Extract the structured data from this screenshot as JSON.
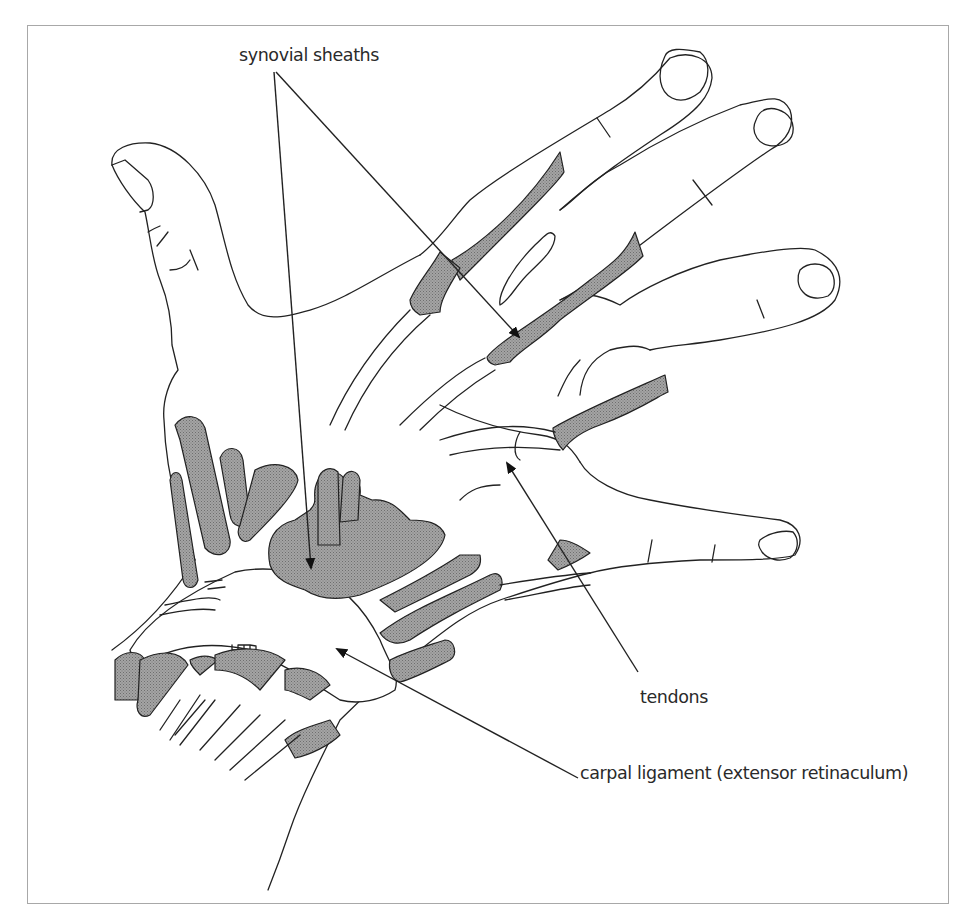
{
  "figure": {
    "frame": {
      "x": 27,
      "y": 25,
      "width": 922,
      "height": 879,
      "border_color": "#a8a8a8"
    },
    "colors": {
      "line": "#222222",
      "sheath_fill": "#9a9a9a",
      "background": "#ffffff",
      "label_text": "#2a2a2a"
    }
  },
  "labels": {
    "synovial_sheaths": {
      "text": "synovial sheaths",
      "x": 239,
      "y": 46
    },
    "tendons": {
      "text": "tendons",
      "x": 640,
      "y": 689
    },
    "carpal_ligament": {
      "text": "carpal ligament (extensor retinaculum)",
      "x": 580,
      "y": 765
    }
  },
  "leader_lines": [
    {
      "name": "synovial-sheaths-arrow-1",
      "from": [
        274,
        72
      ],
      "to": [
        311,
        570
      ]
    },
    {
      "name": "synovial-sheaths-arrow-2",
      "from": [
        276,
        72
      ],
      "to": [
        520,
        338
      ]
    },
    {
      "name": "tendons-arrow",
      "from": [
        638,
        672
      ],
      "to": [
        506,
        462
      ]
    },
    {
      "name": "carpal-ligament-arrow",
      "from": [
        578,
        778
      ],
      "to": [
        335,
        648
      ]
    }
  ]
}
